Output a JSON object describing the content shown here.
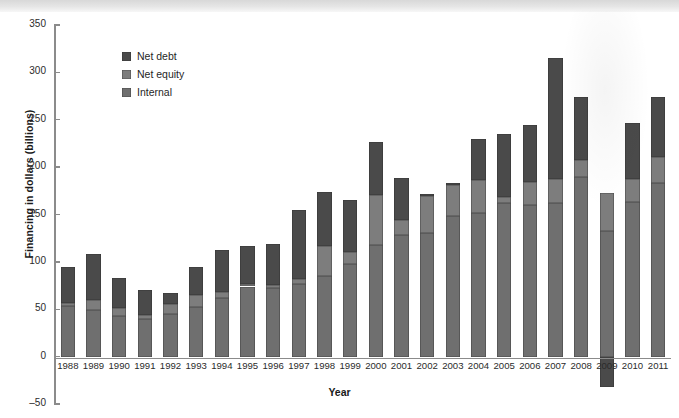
{
  "chart_data": {
    "type": "bar",
    "stacked": true,
    "title": "",
    "xlabel": "Year",
    "ylabel": "Financing in dollars (billions)",
    "ylim": [
      -50,
      350
    ],
    "ytick_values": [
      -50,
      0,
      50,
      100,
      150,
      200,
      250,
      300,
      350
    ],
    "ytick_labels": [
      "‒50",
      "0",
      "50",
      "100",
      "150",
      "200",
      "250",
      "300",
      "350"
    ],
    "grid": false,
    "legend_position": "upper-left-inside",
    "categories": [
      "1988",
      "1989",
      "1990",
      "1991",
      "1992",
      "1993",
      "1994",
      "1995",
      "1996",
      "1997",
      "1998",
      "1999",
      "2000",
      "2001",
      "2002",
      "2003",
      "2004",
      "2005",
      "2006",
      "2007",
      "2008",
      "2009",
      "2010",
      "2011"
    ],
    "series": [
      {
        "name": "Internal",
        "color": "#6f6f6f",
        "values": [
          53,
          49,
          43,
          40,
          45,
          52,
          62,
          74,
          72,
          77,
          85,
          98,
          118,
          128,
          130,
          148,
          152,
          162,
          160,
          162,
          190,
          133,
          163,
          183
        ]
      },
      {
        "name": "Net equity",
        "color": "#7d7d7d",
        "values": [
          4,
          11,
          8,
          4,
          11,
          13,
          6,
          3,
          4,
          5,
          32,
          12,
          53,
          16,
          40,
          33,
          34,
          6,
          24,
          25,
          17,
          40,
          24,
          28
        ]
      },
      {
        "name": "Net debt",
        "color": "#4a4a4a",
        "values": [
          38,
          48,
          32,
          26,
          11,
          30,
          45,
          40,
          43,
          73,
          57,
          55,
          56,
          44,
          2,
          2,
          44,
          67,
          60,
          128,
          67,
          -32,
          60,
          63
        ]
      }
    ],
    "totals": [
      95,
      108,
      83,
      70,
      67,
      95,
      113,
      117,
      119,
      155,
      174,
      165,
      227,
      188,
      172,
      183,
      230,
      235,
      244,
      315,
      274,
      173,
      247,
      274
    ]
  },
  "legend": {
    "items": [
      {
        "label": "Net debt",
        "color": "#4a4a4a"
      },
      {
        "label": "Net equity",
        "color": "#7d7d7d"
      },
      {
        "label": "Internal",
        "color": "#6f6f6f"
      }
    ]
  }
}
